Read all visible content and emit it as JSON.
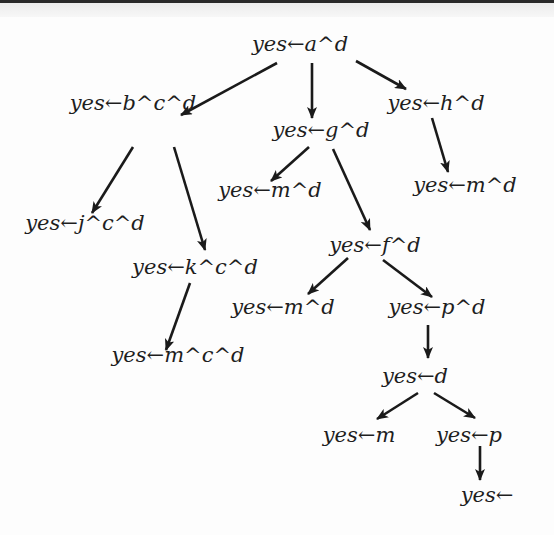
{
  "diagram": {
    "type": "resolution-tree",
    "nodes": [
      {
        "id": "n1",
        "label": "yes←a^d",
        "x": 300,
        "y": 34
      },
      {
        "id": "n2",
        "label": "yes←b^c^d",
        "x": 133,
        "y": 93
      },
      {
        "id": "n3",
        "label": "yes←g^d",
        "x": 321,
        "y": 120
      },
      {
        "id": "n4",
        "label": "yes←h^d",
        "x": 436,
        "y": 93
      },
      {
        "id": "n5",
        "label": "yes←m^d",
        "x": 270,
        "y": 180
      },
      {
        "id": "n6",
        "label": "yes←m^d",
        "x": 465,
        "y": 175
      },
      {
        "id": "n7",
        "label": "yes←j^c^d",
        "x": 85,
        "y": 213
      },
      {
        "id": "n8",
        "label": "yes←f^d",
        "x": 375,
        "y": 235
      },
      {
        "id": "n9",
        "label": "yes←k^c^d",
        "x": 195,
        "y": 257
      },
      {
        "id": "n10",
        "label": "yes←m^d",
        "x": 283,
        "y": 297
      },
      {
        "id": "n11",
        "label": "yes←p^d",
        "x": 437,
        "y": 297
      },
      {
        "id": "n12",
        "label": "yes←m^c^d",
        "x": 178,
        "y": 345
      },
      {
        "id": "n13",
        "label": "yes←d",
        "x": 415,
        "y": 366
      },
      {
        "id": "n14",
        "label": "yes←m",
        "x": 359,
        "y": 425
      },
      {
        "id": "n15",
        "label": "yes←p",
        "x": 469,
        "y": 425
      },
      {
        "id": "n16",
        "label": "yes←",
        "x": 487,
        "y": 485
      }
    ],
    "edges": [
      {
        "from": "n1",
        "to": "n2",
        "x1": 277,
        "y1": 63,
        "x2": 181,
        "y2": 115
      },
      {
        "from": "n1",
        "to": "n3",
        "x1": 312,
        "y1": 63,
        "x2": 312,
        "y2": 118
      },
      {
        "from": "n1",
        "to": "n4",
        "x1": 356,
        "y1": 61,
        "x2": 406,
        "y2": 89
      },
      {
        "from": "n2",
        "to": "n7",
        "x1": 133,
        "y1": 147,
        "x2": 92,
        "y2": 213
      },
      {
        "from": "n2",
        "to": "n9",
        "x1": 174,
        "y1": 147,
        "x2": 205,
        "y2": 250
      },
      {
        "from": "n3",
        "to": "n5",
        "x1": 309,
        "y1": 147,
        "x2": 271,
        "y2": 181
      },
      {
        "from": "n3",
        "to": "n8",
        "x1": 333,
        "y1": 149,
        "x2": 370,
        "y2": 230
      },
      {
        "from": "n4",
        "to": "n6",
        "x1": 432,
        "y1": 118,
        "x2": 448,
        "y2": 172
      },
      {
        "from": "n8",
        "to": "n10",
        "x1": 348,
        "y1": 258,
        "x2": 308,
        "y2": 294
      },
      {
        "from": "n8",
        "to": "n11",
        "x1": 383,
        "y1": 260,
        "x2": 432,
        "y2": 297
      },
      {
        "from": "n9",
        "to": "n12",
        "x1": 190,
        "y1": 283,
        "x2": 166,
        "y2": 350
      },
      {
        "from": "n11",
        "to": "n13",
        "x1": 428,
        "y1": 325,
        "x2": 428,
        "y2": 358
      },
      {
        "from": "n13",
        "to": "n14",
        "x1": 418,
        "y1": 393,
        "x2": 377,
        "y2": 419
      },
      {
        "from": "n13",
        "to": "n15",
        "x1": 434,
        "y1": 393,
        "x2": 475,
        "y2": 418
      },
      {
        "from": "n15",
        "to": "n16",
        "x1": 480,
        "y1": 446,
        "x2": 480,
        "y2": 480
      }
    ],
    "colors": {
      "text": "#1e1e1e",
      "edge": "#1a1a1a",
      "background": "#fdfdfd",
      "top_rule": "#2a2a2a"
    }
  }
}
